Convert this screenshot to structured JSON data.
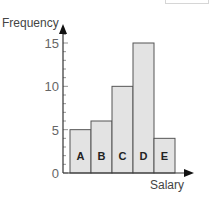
{
  "chart_data": {
    "type": "bar",
    "title": "",
    "xlabel": "Salary",
    "ylabel": "Frequency",
    "categories": [
      "A",
      "B",
      "C",
      "D",
      "E"
    ],
    "values": [
      5,
      6,
      10,
      15,
      4
    ],
    "ylim": [
      0,
      16
    ],
    "yticks": [
      0,
      5,
      10,
      15
    ],
    "minor_tick_step": 1,
    "grid": false,
    "legend": "none",
    "bar_gap": 0,
    "colors": {
      "bar_fill": "#e3e3e3",
      "bar_edge": "#555555",
      "axis": "#333333",
      "text": "#555555",
      "label_text": "#222222"
    }
  }
}
